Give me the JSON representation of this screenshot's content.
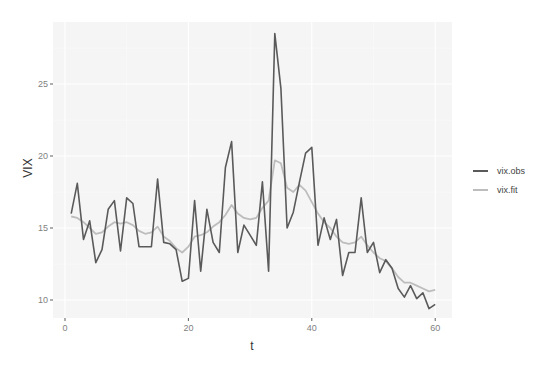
{
  "chart_data": {
    "type": "line",
    "title": "",
    "xlabel": "t",
    "ylabel": "VIX",
    "xlim": [
      -1.9,
      62.7
    ],
    "ylim": [
      8.7,
      29.2
    ],
    "xticks": [
      0,
      20,
      40,
      60
    ],
    "yticks": [
      10,
      15,
      20,
      25
    ],
    "grid": true,
    "legend_position": "right",
    "x": [
      1,
      2,
      3,
      4,
      5,
      6,
      7,
      8,
      9,
      10,
      11,
      12,
      13,
      14,
      15,
      16,
      17,
      18,
      19,
      20,
      21,
      22,
      23,
      24,
      25,
      26,
      27,
      28,
      29,
      30,
      31,
      32,
      33,
      34,
      35,
      36,
      37,
      38,
      39,
      40,
      41,
      42,
      43,
      44,
      45,
      46,
      47,
      48,
      49,
      50,
      51,
      52,
      53,
      54,
      55,
      56,
      57,
      58,
      59,
      60
    ],
    "series": [
      {
        "name": "vix.obs",
        "color": "#5a5a5a",
        "values": [
          16.0,
          18.1,
          14.2,
          15.5,
          12.6,
          13.5,
          16.3,
          16.9,
          13.4,
          17.1,
          16.7,
          13.7,
          13.7,
          13.7,
          18.4,
          14.0,
          13.9,
          13.5,
          11.3,
          11.5,
          16.9,
          12.0,
          16.3,
          14.0,
          13.3,
          19.2,
          21.0,
          13.3,
          15.2,
          14.5,
          13.8,
          18.2,
          12.0,
          28.5,
          24.7,
          15.0,
          16.1,
          18.2,
          20.2,
          20.6,
          13.8,
          15.7,
          14.2,
          15.6,
          11.7,
          13.3,
          13.3,
          17.1,
          13.3,
          14.0,
          11.9,
          12.8,
          12.2,
          10.8,
          10.2,
          11.0,
          10.1,
          10.5,
          9.4,
          9.7
        ]
      },
      {
        "name": "vix.fit",
        "color": "#bdbdbd",
        "values": [
          15.8,
          15.7,
          15.4,
          15.0,
          14.6,
          14.7,
          15.1,
          15.4,
          15.3,
          15.4,
          15.2,
          14.8,
          14.6,
          14.7,
          15.1,
          14.4,
          14.1,
          13.6,
          13.3,
          13.7,
          14.4,
          14.5,
          14.7,
          15.1,
          15.4,
          15.9,
          16.6,
          16.0,
          15.7,
          15.6,
          15.7,
          16.4,
          16.9,
          19.7,
          19.5,
          17.8,
          17.5,
          18.0,
          17.6,
          16.8,
          16.0,
          15.4,
          15.0,
          14.4,
          14.0,
          13.9,
          14.0,
          14.4,
          13.8,
          13.3,
          12.9,
          12.7,
          12.2,
          11.6,
          11.2,
          11.2,
          11.0,
          10.8,
          10.6,
          10.7
        ]
      }
    ]
  },
  "axes": {
    "x_title": "t",
    "y_title": "VIX",
    "x_tick_labels": [
      "0",
      "20",
      "40",
      "60"
    ],
    "y_tick_labels": [
      "10",
      "15",
      "20",
      "25"
    ]
  },
  "legend": {
    "items": [
      {
        "label": "vix.obs",
        "color": "#5a5a5a"
      },
      {
        "label": "vix.fit",
        "color": "#bdbdbd"
      }
    ]
  },
  "style": {
    "panel_bg": "#f5f5f5",
    "grid_major": "#ffffff",
    "grid_minor": "#fafafa"
  }
}
